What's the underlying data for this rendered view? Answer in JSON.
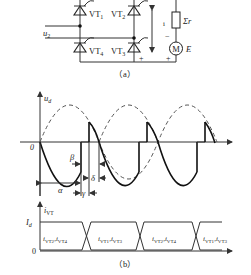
{
  "circuit": {
    "thyristors": [
      {
        "label": "VT",
        "sub": "1"
      },
      {
        "label": "VT",
        "sub": "2"
      },
      {
        "label": "VT",
        "sub": "3"
      },
      {
        "label": "VT",
        "sub": "4"
      }
    ],
    "source_label": "u",
    "source_sub": "2",
    "resistor_label": "Σr",
    "motor_symbol": "M",
    "motor_emf": "E",
    "current_label": "i",
    "plus": "+",
    "minus": "−",
    "caption": "（a）"
  },
  "waveform": {
    "y_label": "u",
    "y_sub": "d",
    "origin": "0",
    "beta": "β",
    "alpha": "α",
    "gamma": "γ",
    "delta": "δ"
  },
  "current": {
    "y_label": "i",
    "y_sub": "VT",
    "level": "I",
    "level_sub": "d",
    "zero": "0",
    "segments": [
      {
        "a": "i",
        "a_sub": "VT2",
        "b": "i",
        "b_sub": "VT4"
      },
      {
        "a": "i",
        "a_sub": "VT1",
        "b": "i",
        "b_sub": "VT3"
      },
      {
        "a": "i",
        "a_sub": "VT2",
        "b": "i",
        "b_sub": "VT4"
      },
      {
        "a": "i",
        "a_sub": "VT1",
        "b": "i",
        "b_sub": "VT3"
      }
    ],
    "caption": "（b）"
  }
}
